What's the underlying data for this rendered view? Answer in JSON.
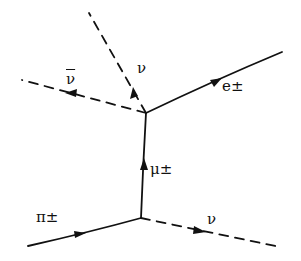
{
  "diagram": {
    "type": "feynman",
    "colors": {
      "ink": "#111111",
      "background": "#ffffff"
    },
    "labels": {
      "pion": "π±",
      "neutrino_bottom": "ν",
      "muon": "μ±",
      "electron": "e±",
      "neutrino_top": "ν",
      "antineutrino": "ν"
    },
    "vertices": [
      {
        "id": "v1",
        "x": 141,
        "y": 218
      },
      {
        "id": "v2",
        "x": 146,
        "y": 113
      }
    ],
    "edges": [
      {
        "from": "in",
        "to": "v1",
        "particle": "π±",
        "style": "solid"
      },
      {
        "from": "v1",
        "to": "out",
        "particle": "ν",
        "style": "dashed"
      },
      {
        "from": "v1",
        "to": "v2",
        "particle": "μ±",
        "style": "solid"
      },
      {
        "from": "v2",
        "to": "out",
        "particle": "e±",
        "style": "solid"
      },
      {
        "from": "v2",
        "to": "out",
        "particle": "ν",
        "style": "dashed"
      },
      {
        "from": "v2",
        "to": "out",
        "particle": "ν̄",
        "style": "dashed"
      }
    ]
  }
}
